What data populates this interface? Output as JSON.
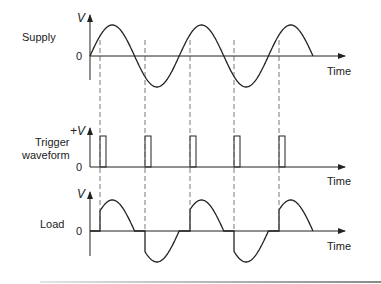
{
  "diagram": {
    "panels": [
      {
        "id": "supply",
        "label": "Supply",
        "y_axis_label": "V",
        "zero_label": "0",
        "x_axis_label": "Time"
      },
      {
        "id": "trigger",
        "label_line1": "Trigger",
        "label_line2": "waveform",
        "y_axis_label": "+V",
        "zero_label": "0",
        "x_axis_label": "Time"
      },
      {
        "id": "load",
        "label": "Load",
        "y_axis_label": "V",
        "zero_label": "0",
        "x_axis_label": "Time"
      }
    ],
    "colors": {
      "line": "#222222",
      "dash": "#555555",
      "footer_rule": "#888888"
    },
    "firing_points_px": [
      100,
      145,
      190,
      234,
      279
    ],
    "half_period_px": 44.6
  }
}
